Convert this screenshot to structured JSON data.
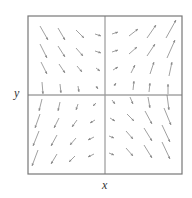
{
  "chart_data": {
    "type": "vector_field",
    "title": "",
    "xlabel": "x",
    "ylabel": "y",
    "frame": {
      "left": 28,
      "top": 16,
      "right": 182,
      "bottom": 174
    },
    "axes": {
      "x_axis_y": 95,
      "y_axis_x": 105
    },
    "colors": {
      "frame": "#777777",
      "axis": "#999999",
      "arrow": "#888888"
    },
    "grid_columns_px": [
      44,
      62,
      80,
      98,
      115,
      133,
      151,
      170
    ],
    "grid_rows_px": [
      34,
      52,
      70,
      88,
      104,
      122,
      140,
      158
    ],
    "arrows": [
      {
        "x1": 40,
        "y1": 26,
        "x2": 48,
        "y2": 40
      },
      {
        "x1": 58,
        "y1": 28,
        "x2": 65,
        "y2": 40
      },
      {
        "x1": 76,
        "y1": 30,
        "x2": 84,
        "y2": 38
      },
      {
        "x1": 95,
        "y1": 34,
        "x2": 101,
        "y2": 36
      },
      {
        "x1": 112,
        "y1": 34,
        "x2": 118,
        "y2": 32
      },
      {
        "x1": 129,
        "y1": 36,
        "x2": 138,
        "y2": 29
      },
      {
        "x1": 147,
        "y1": 38,
        "x2": 156,
        "y2": 25
      },
      {
        "x1": 166,
        "y1": 38,
        "x2": 176,
        "y2": 20
      },
      {
        "x1": 40,
        "y1": 44,
        "x2": 47,
        "y2": 58
      },
      {
        "x1": 58,
        "y1": 46,
        "x2": 65,
        "y2": 57
      },
      {
        "x1": 76,
        "y1": 48,
        "x2": 83,
        "y2": 56
      },
      {
        "x1": 95,
        "y1": 51,
        "x2": 101,
        "y2": 53
      },
      {
        "x1": 112,
        "y1": 52,
        "x2": 118,
        "y2": 50
      },
      {
        "x1": 129,
        "y1": 54,
        "x2": 137,
        "y2": 47
      },
      {
        "x1": 147,
        "y1": 56,
        "x2": 155,
        "y2": 44
      },
      {
        "x1": 167,
        "y1": 58,
        "x2": 175,
        "y2": 40
      },
      {
        "x1": 41,
        "y1": 62,
        "x2": 47,
        "y2": 74
      },
      {
        "x1": 59,
        "y1": 64,
        "x2": 65,
        "y2": 73
      },
      {
        "x1": 77,
        "y1": 66,
        "x2": 82,
        "y2": 72
      },
      {
        "x1": 96,
        "y1": 68,
        "x2": 100,
        "y2": 71
      },
      {
        "x1": 113,
        "y1": 70,
        "x2": 118,
        "y2": 67
      },
      {
        "x1": 131,
        "y1": 73,
        "x2": 135,
        "y2": 65
      },
      {
        "x1": 150,
        "y1": 74,
        "x2": 154,
        "y2": 62
      },
      {
        "x1": 169,
        "y1": 76,
        "x2": 172,
        "y2": 62
      },
      {
        "x1": 42,
        "y1": 82,
        "x2": 43,
        "y2": 94
      },
      {
        "x1": 60,
        "y1": 84,
        "x2": 61,
        "y2": 93
      },
      {
        "x1": 78,
        "y1": 86,
        "x2": 79,
        "y2": 92
      },
      {
        "x1": 96,
        "y1": 86,
        "x2": 98,
        "y2": 89
      },
      {
        "x1": 114,
        "y1": 86,
        "x2": 116,
        "y2": 83
      },
      {
        "x1": 133,
        "y1": 90,
        "x2": 134,
        "y2": 81
      },
      {
        "x1": 149,
        "y1": 92,
        "x2": 150,
        "y2": 83
      },
      {
        "x1": 168,
        "y1": 94,
        "x2": 168,
        "y2": 84
      },
      {
        "x1": 42,
        "y1": 99,
        "x2": 39,
        "y2": 111
      },
      {
        "x1": 60,
        "y1": 102,
        "x2": 58,
        "y2": 111
      },
      {
        "x1": 78,
        "y1": 104,
        "x2": 76,
        "y2": 110
      },
      {
        "x1": 96,
        "y1": 103,
        "x2": 93,
        "y2": 106
      },
      {
        "x1": 112,
        "y1": 100,
        "x2": 115,
        "y2": 104
      },
      {
        "x1": 130,
        "y1": 97,
        "x2": 133,
        "y2": 104
      },
      {
        "x1": 148,
        "y1": 97,
        "x2": 150,
        "y2": 108
      },
      {
        "x1": 167,
        "y1": 95,
        "x2": 169,
        "y2": 110
      },
      {
        "x1": 40,
        "y1": 114,
        "x2": 35,
        "y2": 128
      },
      {
        "x1": 59,
        "y1": 118,
        "x2": 54,
        "y2": 128
      },
      {
        "x1": 77,
        "y1": 120,
        "x2": 72,
        "y2": 127
      },
      {
        "x1": 95,
        "y1": 120,
        "x2": 90,
        "y2": 123
      },
      {
        "x1": 110,
        "y1": 118,
        "x2": 115,
        "y2": 121
      },
      {
        "x1": 127,
        "y1": 114,
        "x2": 134,
        "y2": 121
      },
      {
        "x1": 145,
        "y1": 111,
        "x2": 152,
        "y2": 124
      },
      {
        "x1": 164,
        "y1": 108,
        "x2": 171,
        "y2": 125
      },
      {
        "x1": 39,
        "y1": 131,
        "x2": 33,
        "y2": 146
      },
      {
        "x1": 57,
        "y1": 135,
        "x2": 51,
        "y2": 146
      },
      {
        "x1": 76,
        "y1": 138,
        "x2": 70,
        "y2": 145
      },
      {
        "x1": 94,
        "y1": 137,
        "x2": 88,
        "y2": 140
      },
      {
        "x1": 109,
        "y1": 136,
        "x2": 114,
        "y2": 138
      },
      {
        "x1": 126,
        "y1": 131,
        "x2": 133,
        "y2": 139
      },
      {
        "x1": 144,
        "y1": 128,
        "x2": 152,
        "y2": 141
      },
      {
        "x1": 162,
        "y1": 125,
        "x2": 170,
        "y2": 142
      },
      {
        "x1": 38,
        "y1": 150,
        "x2": 32,
        "y2": 166
      },
      {
        "x1": 57,
        "y1": 154,
        "x2": 51,
        "y2": 164
      },
      {
        "x1": 75,
        "y1": 156,
        "x2": 69,
        "y2": 162
      },
      {
        "x1": 94,
        "y1": 154,
        "x2": 88,
        "y2": 157
      },
      {
        "x1": 109,
        "y1": 153,
        "x2": 114,
        "y2": 155
      },
      {
        "x1": 126,
        "y1": 148,
        "x2": 133,
        "y2": 156
      },
      {
        "x1": 144,
        "y1": 145,
        "x2": 152,
        "y2": 158
      },
      {
        "x1": 162,
        "y1": 142,
        "x2": 170,
        "y2": 159
      }
    ]
  }
}
